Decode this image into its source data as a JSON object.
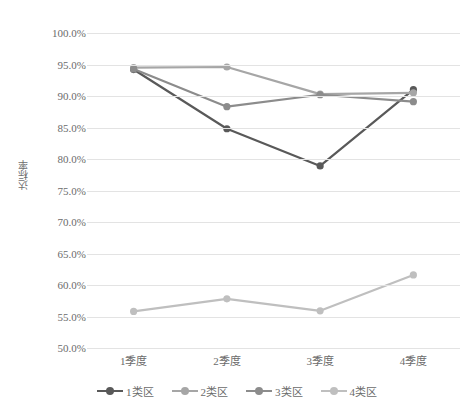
{
  "chart_data": {
    "type": "line",
    "title": "",
    "subtitle": "",
    "xlabel": "",
    "ylabel": "达标率",
    "categories": [
      "1季度",
      "2季度",
      "3季度",
      "4季度"
    ],
    "ylim": [
      50,
      100
    ],
    "ytick_step": 5,
    "ytick_labels": [
      "100.0%",
      "95.0%",
      "90.0%",
      "85.0%",
      "80.0%",
      "75.0%",
      "70.0%",
      "65.0%",
      "60.0%",
      "55.0%",
      "50.0%"
    ],
    "ytick_values": [
      100,
      95,
      90,
      85,
      80,
      75,
      70,
      65,
      60,
      55,
      50
    ],
    "grid": true,
    "grid_axis": "y",
    "legend_position": "bottom",
    "value_suffix": "%",
    "series": [
      {
        "name": "1类区",
        "color": "#595959",
        "values": [
          94.2,
          84.8,
          78.9,
          91.0
        ]
      },
      {
        "name": "2类区",
        "color": "#a6a6a6",
        "values": [
          94.5,
          94.6,
          90.3,
          90.5
        ]
      },
      {
        "name": "3类区",
        "color": "#8c8c8c",
        "values": [
          94.3,
          88.3,
          90.2,
          89.1
        ]
      },
      {
        "name": "4类区",
        "color": "#bfbfbf",
        "values": [
          55.8,
          57.8,
          55.9,
          61.6
        ]
      }
    ]
  },
  "colors": {
    "background": "#ffffff",
    "gridline": "#e3e3e3",
    "text": "#6b6b6b",
    "series_1": "#595959",
    "series_2": "#a6a6a6",
    "series_3": "#8c8c8c",
    "series_4": "#bfbfbf"
  }
}
